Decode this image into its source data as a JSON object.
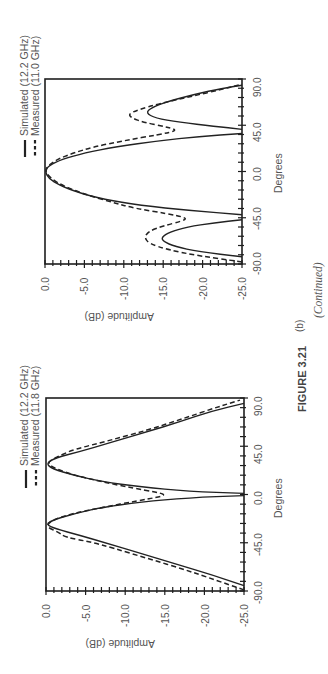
{
  "figure": {
    "label": "FIGURE 3.21",
    "continued": "(Continued)",
    "panel": "(b)"
  },
  "chart_data": [
    {
      "type": "line",
      "orientation_note": "page rotated 90 degrees",
      "title": "",
      "xlabel": "Degrees",
      "ylabel": "Amplitude (dB)",
      "xlim": [
        -90,
        90
      ],
      "ylim": [
        -25,
        0
      ],
      "x_ticks": [
        "-90.0",
        "-45.0",
        "0.0",
        "45.0",
        "90.0"
      ],
      "y_ticks": [
        "0.0",
        "-5.0",
        "-10.0",
        "-15.0",
        "-20.0",
        "-25.0"
      ],
      "legend": [
        "Simulated (12.2 GHz)",
        "Measured (11.0 GHz)"
      ],
      "series": [
        {
          "name": "Simulated (12.2 GHz)",
          "style": "solid",
          "segments": [
            [
              [
                -83,
                -25
              ],
              [
                -78,
                -19.5
              ],
              [
                -73,
                -16.5
              ],
              [
                -68,
                -15.0
              ],
              [
                -64,
                -14.8
              ],
              [
                -59,
                -15.8
              ],
              [
                -54,
                -18.0
              ],
              [
                -50,
                -21.5
              ],
              [
                -47,
                -25
              ]
            ],
            [
              [
                -42,
                -25
              ],
              [
                -38,
                -18.5
              ],
              [
                -33,
                -12.0
              ],
              [
                -27,
                -7.5
              ],
              [
                -20,
                -4.0
              ],
              [
                -13,
                -1.8
              ],
              [
                -7,
                -0.5
              ],
              [
                0,
                0
              ],
              [
                6,
                -0.5
              ],
              [
                12,
                -2.2
              ],
              [
                18,
                -5.0
              ],
              [
                24,
                -9.0
              ],
              [
                30,
                -14.5
              ],
              [
                34,
                -19.5
              ],
              [
                37,
                -25
              ]
            ],
            [
              [
                41,
                -25
              ],
              [
                44,
                -21.5
              ],
              [
                48,
                -17.0
              ],
              [
                52,
                -14.0
              ],
              [
                57,
                -12.8
              ],
              [
                62,
                -13.5
              ],
              [
                68,
                -15.5
              ],
              [
                75,
                -19.0
              ],
              [
                81,
                -22.5
              ],
              [
                84,
                -25
              ]
            ]
          ]
        },
        {
          "name": "Measured (11.0 GHz)",
          "style": "dashed",
          "segments": [
            [
              [
                -88,
                -25
              ],
              [
                -82,
                -19.5
              ],
              [
                -76,
                -15.5
              ],
              [
                -70,
                -13.2
              ],
              [
                -64,
                -12.6
              ],
              [
                -58,
                -13.2
              ],
              [
                -53,
                -15.0
              ],
              [
                -48,
                -17.5
              ],
              [
                -45,
                -18.0
              ],
              [
                -41,
                -15.5
              ],
              [
                -36,
                -11.5
              ],
              [
                -30,
                -8.5
              ],
              [
                -22,
                -5.0
              ],
              [
                -14,
                -2.3
              ],
              [
                -7,
                -0.8
              ],
              [
                0,
                0.0
              ],
              [
                6,
                -0.4
              ],
              [
                12,
                -1.6
              ],
              [
                18,
                -3.6
              ],
              [
                24,
                -6.2
              ],
              [
                30,
                -10.0
              ],
              [
                36,
                -14.5
              ],
              [
                40,
                -17.0
              ],
              [
                44,
                -15.0
              ],
              [
                48,
                -12.5
              ],
              [
                52,
                -11.0
              ],
              [
                56,
                -10.6
              ],
              [
                60,
                -11.8
              ],
              [
                66,
                -14.5
              ],
              [
                73,
                -18.5
              ],
              [
                80,
                -22.5
              ],
              [
                85,
                -25
              ]
            ]
          ]
        }
      ]
    },
    {
      "type": "line",
      "orientation_note": "page rotated 90 degrees",
      "title": "",
      "xlabel": "Degrees",
      "ylabel": "Amplitude (dB)",
      "xlim": [
        -90,
        90
      ],
      "ylim": [
        -25,
        0
      ],
      "x_ticks": [
        "-90.0",
        "-45.0",
        "0.0",
        "45.0",
        "90.0"
      ],
      "y_ticks": [
        "0.0",
        "-5.0",
        "-10.0",
        "-15.0",
        "-20.0",
        "-25.0"
      ],
      "legend": [
        "Simulated (12.2 GHz)",
        "Measured (11.8 GHz)"
      ],
      "series": [
        {
          "name": "Simulated (12.2 GHz)",
          "style": "solid",
          "segments": [
            [
              [
                -85,
                -25
              ],
              [
                -75,
                -21.0
              ],
              [
                -65,
                -16.5
              ],
              [
                -55,
                -12.0
              ],
              [
                -45,
                -7.5
              ],
              [
                -38,
                -4.2
              ],
              [
                -32,
                -1.2
              ],
              [
                -28,
                0
              ],
              [
                -24,
                -0.8
              ],
              [
                -18,
                -3.5
              ],
              [
                -12,
                -7.0
              ],
              [
                -7,
                -12.0
              ],
              [
                -3,
                -18.0
              ],
              [
                -1,
                -25
              ]
            ],
            [
              [
                1,
                -25
              ],
              [
                3,
                -18.0
              ],
              [
                7,
                -12.0
              ],
              [
                12,
                -7.0
              ],
              [
                18,
                -3.5
              ],
              [
                24,
                -0.8
              ],
              [
                29,
                0
              ],
              [
                34,
                -1.2
              ],
              [
                40,
                -4.2
              ],
              [
                48,
                -8.0
              ],
              [
                58,
                -12.5
              ],
              [
                68,
                -17.0
              ],
              [
                78,
                -21.0
              ],
              [
                85,
                -25
              ]
            ]
          ]
        },
        {
          "name": "Measured (11.8 GHz)",
          "style": "dashed",
          "segments": [
            [
              [
                -89,
                -25
              ],
              [
                -80,
                -21.5
              ],
              [
                -70,
                -17.5
              ],
              [
                -60,
                -13.0
              ],
              [
                -50,
                -8.5
              ],
              [
                -44,
                -5.5
              ],
              [
                -40,
                -2.5
              ],
              [
                -35,
                -1.5
              ],
              [
                -30,
                0.0
              ],
              [
                -24,
                -0.7
              ],
              [
                -18,
                -3.2
              ],
              [
                -12,
                -7.2
              ],
              [
                -6,
                -11.5
              ],
              [
                -2,
                -14.5
              ],
              [
                0,
                -15.0
              ],
              [
                2,
                -14.0
              ],
              [
                6,
                -11.0
              ],
              [
                12,
                -7.0
              ],
              [
                18,
                -3.6
              ],
              [
                24,
                -1.2
              ],
              [
                29,
                -0.2
              ],
              [
                33,
                -0.8
              ],
              [
                37,
                -2.0
              ],
              [
                42,
                -3.5
              ],
              [
                50,
                -7.8
              ],
              [
                60,
                -12.8
              ],
              [
                70,
                -17.0
              ],
              [
                80,
                -21.0
              ],
              [
                88,
                -24.5
              ]
            ]
          ]
        }
      ]
    }
  ],
  "colors": {
    "line": "#222222",
    "frame": "#1e1e1e",
    "text": "#555555"
  }
}
